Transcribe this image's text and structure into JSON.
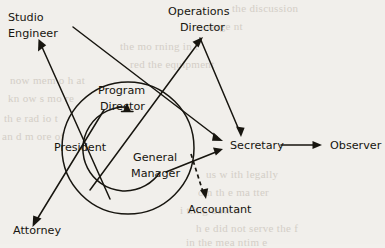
{
  "diagram": {
    "background_color": "#f1efeb",
    "ink_color": "#17150f",
    "nodes": [
      {
        "id": "studio_engineer",
        "label_line1": "Studio",
        "label_line2": "Engineer",
        "x": 8,
        "y": 12
      },
      {
        "id": "operations_director",
        "label_line1": "Operations",
        "label_line2": "Director",
        "x": 168,
        "y": 6
      },
      {
        "id": "program_director",
        "label_line1": "Program",
        "label_line2": "Director",
        "x": 95,
        "y": 85
      },
      {
        "id": "president",
        "label_line1": "President",
        "label_line2": "",
        "x": 54,
        "y": 142
      },
      {
        "id": "general_manager",
        "label_line1": "General",
        "label_line2": "Manager",
        "x": 131,
        "y": 152
      },
      {
        "id": "secretary",
        "label_line1": "Secretary",
        "label_line2": "",
        "x": 230,
        "y": 146
      },
      {
        "id": "observer",
        "label_line1": "Observer",
        "label_line2": "",
        "x": 330,
        "y": 146
      },
      {
        "id": "accountant",
        "label_line1": "Accountant",
        "label_line2": "",
        "x": 193,
        "y": 204
      },
      {
        "id": "attorney",
        "label_line1": "Attorney",
        "label_line2": "",
        "x": 13,
        "y": 231
      }
    ],
    "edges": [
      {
        "id": "president-to-studio-engineer",
        "from": "president",
        "to": "studio_engineer",
        "style": "solid",
        "arrow": "end"
      },
      {
        "id": "president-to-attorney",
        "from": "president",
        "to": "attorney",
        "style": "solid",
        "arrow": "end"
      },
      {
        "id": "president-to-operations-director",
        "from": "president",
        "to": "operations_director",
        "style": "solid",
        "arrow": "end"
      },
      {
        "id": "studio-engineer-to-secretary",
        "from": "studio_engineer",
        "to": "secretary",
        "style": "solid",
        "arrow": "end"
      },
      {
        "id": "operations-director-to-secretary",
        "from": "operations_director",
        "to": "secretary",
        "style": "solid",
        "arrow": "end"
      },
      {
        "id": "general-manager-to-secretary",
        "from": "general_manager",
        "to": "secretary",
        "style": "solid",
        "arrow": "end"
      },
      {
        "id": "general-manager-to-program-director",
        "from": "general_manager",
        "to": "program_director",
        "style": "curved",
        "arrow": "end"
      },
      {
        "id": "secretary-to-observer",
        "from": "secretary",
        "to": "observer",
        "style": "solid",
        "arrow": "end"
      },
      {
        "id": "secretary-to-accountant",
        "from": "secretary",
        "to": "accountant",
        "style": "dashed",
        "arrow": "end"
      }
    ],
    "shapes": [
      {
        "id": "outer-circle",
        "type": "circle",
        "cx": 128,
        "cy": 148,
        "r": 66
      },
      {
        "id": "inner-arc",
        "type": "arc",
        "cx": 128,
        "cy": 148,
        "r": 42
      }
    ],
    "ghost_text": [
      {
        "text": "the discussion",
        "x": 232,
        "y": 2,
        "size": 11
      },
      {
        "text": "a  sarge  nt",
        "x": 198,
        "y": 20,
        "size": 11
      },
      {
        "text": "the  mo rning  in  t",
        "x": 120,
        "y": 40,
        "size": 11
      },
      {
        "text": "red  the  equipment",
        "x": 130,
        "y": 58,
        "size": 11
      },
      {
        "text": "now  mem o  h at",
        "x": 10,
        "y": 74,
        "size": 11
      },
      {
        "text": "kn ow  s   mo re",
        "x": 8,
        "y": 92,
        "size": 11
      },
      {
        "text": "th e  rad io  t",
        "x": 4,
        "y": 112,
        "size": 11
      },
      {
        "text": "an d  m ore  of",
        "x": 2,
        "y": 130,
        "size": 11
      },
      {
        "text": "us  w ith   legally",
        "x": 206,
        "y": 168,
        "size": 11
      },
      {
        "text": "o n   th e   ma tter",
        "x": 198,
        "y": 186,
        "size": 11
      },
      {
        "text": "i tting  dow n",
        "x": 180,
        "y": 204,
        "size": 11
      },
      {
        "text": "h e  did  not  serve  the  f",
        "x": 196,
        "y": 222,
        "size": 11
      },
      {
        "text": "in  the  mea ntim e",
        "x": 186,
        "y": 236,
        "size": 11
      }
    ]
  }
}
